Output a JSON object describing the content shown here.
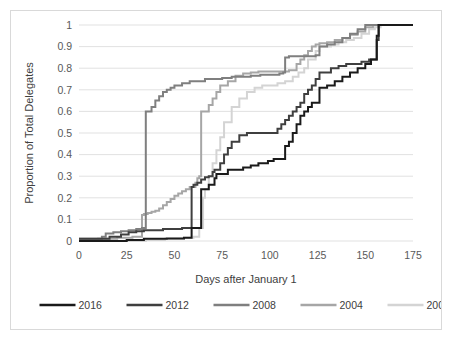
{
  "chart_data": {
    "type": "line",
    "title": "",
    "xlabel": "Days after January 1",
    "ylabel": "Proportion of Total Delegates",
    "xlim": [
      0,
      175
    ],
    "ylim": [
      0,
      1
    ],
    "xticks": [
      "0",
      "25",
      "50",
      "75",
      "100",
      "125",
      "150",
      "175"
    ],
    "xtick_values": [
      0,
      25,
      50,
      75,
      100,
      125,
      150,
      175
    ],
    "yticks": [
      "0",
      "0.1",
      "0.2",
      "0.3",
      "0.4",
      "0.5",
      "0.6",
      "0.7",
      "0.8",
      "0.9",
      "1"
    ],
    "ytick_values": [
      0,
      0.1,
      0.2,
      0.3,
      0.4,
      0.5,
      0.6,
      0.7,
      0.8,
      0.9,
      1
    ],
    "grid": "horizontal",
    "legend_position": "bottom",
    "series": [
      {
        "name": "2016",
        "color": "#1a1a1a",
        "width": 2.0,
        "x": [
          0,
          22,
          25,
          31,
          34,
          40,
          46,
          50,
          55,
          58,
          59,
          60,
          62,
          64,
          66,
          68,
          70,
          71,
          72,
          74,
          78,
          82,
          86,
          90,
          94,
          99,
          102,
          106,
          108,
          110,
          112,
          114,
          116,
          118,
          120,
          122,
          124,
          126,
          130,
          134,
          138,
          142,
          146,
          150,
          153,
          155,
          156,
          157,
          160,
          175
        ],
        "y": [
          0.0,
          0.0,
          0.005,
          0.005,
          0.01,
          0.01,
          0.012,
          0.012,
          0.015,
          0.015,
          0.06,
          0.06,
          0.06,
          0.24,
          0.24,
          0.26,
          0.26,
          0.29,
          0.31,
          0.31,
          0.33,
          0.33,
          0.34,
          0.35,
          0.36,
          0.37,
          0.38,
          0.38,
          0.44,
          0.46,
          0.5,
          0.54,
          0.58,
          0.6,
          0.62,
          0.64,
          0.64,
          0.71,
          0.72,
          0.74,
          0.76,
          0.78,
          0.8,
          0.82,
          0.84,
          0.84,
          0.95,
          1.0,
          1.0,
          1.0
        ]
      },
      {
        "name": "2012",
        "color": "#3f3f3f",
        "width": 2.0,
        "x": [
          0,
          10,
          16,
          22,
          26,
          30,
          34,
          38,
          44,
          50,
          54,
          57,
          58,
          59,
          60,
          62,
          64,
          66,
          68,
          70,
          71,
          72,
          74,
          76,
          78,
          80,
          84,
          88,
          92,
          96,
          100,
          104,
          106,
          108,
          110,
          112,
          114,
          116,
          118,
          120,
          122,
          124,
          126,
          128,
          132,
          136,
          140,
          144,
          148,
          152,
          155,
          156,
          157,
          160,
          175
        ],
        "y": [
          0.01,
          0.01,
          0.02,
          0.03,
          0.04,
          0.045,
          0.05,
          0.05,
          0.055,
          0.055,
          0.06,
          0.06,
          0.06,
          0.25,
          0.26,
          0.27,
          0.285,
          0.295,
          0.3,
          0.32,
          0.33,
          0.33,
          0.36,
          0.4,
          0.43,
          0.46,
          0.49,
          0.5,
          0.5,
          0.5,
          0.5,
          0.52,
          0.54,
          0.56,
          0.58,
          0.6,
          0.62,
          0.64,
          0.68,
          0.7,
          0.72,
          0.75,
          0.78,
          0.78,
          0.8,
          0.81,
          0.82,
          0.82,
          0.83,
          0.84,
          0.84,
          0.93,
          1.0,
          1.0,
          1.0
        ]
      },
      {
        "name": "2008",
        "color": "#7f7f7f",
        "width": 2.0,
        "x": [
          0,
          8,
          12,
          14,
          18,
          22,
          26,
          30,
          33,
          34,
          35,
          36,
          38,
          40,
          42,
          44,
          46,
          48,
          50,
          54,
          58,
          62,
          66,
          70,
          75,
          80,
          85,
          90,
          95,
          100,
          105,
          107,
          108,
          110,
          114,
          118,
          122,
          124,
          126,
          130,
          134,
          138,
          142,
          146,
          150,
          152,
          154,
          156,
          160,
          175
        ],
        "y": [
          0.01,
          0.01,
          0.02,
          0.035,
          0.04,
          0.045,
          0.05,
          0.055,
          0.06,
          0.06,
          0.6,
          0.6,
          0.62,
          0.65,
          0.67,
          0.69,
          0.7,
          0.71,
          0.72,
          0.73,
          0.74,
          0.74,
          0.75,
          0.75,
          0.755,
          0.76,
          0.76,
          0.765,
          0.77,
          0.77,
          0.775,
          0.78,
          0.85,
          0.855,
          0.855,
          0.855,
          0.855,
          0.86,
          0.9,
          0.91,
          0.92,
          0.94,
          0.96,
          0.98,
          1.0,
          1.0,
          1.0,
          1.0,
          1.0,
          1.0
        ]
      },
      {
        "name": "2004",
        "color": "#a6a6a6",
        "width": 2.0,
        "x": [
          0,
          10,
          20,
          28,
          32,
          33,
          34,
          36,
          38,
          40,
          42,
          44,
          46,
          48,
          50,
          52,
          54,
          56,
          58,
          60,
          61,
          62,
          63,
          64,
          66,
          68,
          70,
          72,
          74,
          78,
          82,
          86,
          90,
          94,
          98,
          102,
          106,
          110,
          112,
          114,
          116,
          118,
          120,
          122,
          124,
          126,
          130,
          134,
          138,
          142,
          146,
          150,
          154,
          158,
          160,
          165,
          175
        ],
        "y": [
          0.005,
          0.01,
          0.015,
          0.02,
          0.02,
          0.12,
          0.125,
          0.13,
          0.135,
          0.14,
          0.15,
          0.165,
          0.18,
          0.195,
          0.21,
          0.22,
          0.23,
          0.24,
          0.25,
          0.25,
          0.27,
          0.29,
          0.3,
          0.6,
          0.6,
          0.63,
          0.66,
          0.69,
          0.72,
          0.74,
          0.765,
          0.775,
          0.78,
          0.785,
          0.785,
          0.785,
          0.785,
          0.79,
          0.79,
          0.82,
          0.84,
          0.86,
          0.88,
          0.9,
          0.91,
          0.915,
          0.92,
          0.93,
          0.94,
          0.955,
          0.97,
          0.99,
          1.0,
          1.0,
          1.0,
          1.0,
          1.0
        ]
      },
      {
        "name": "2000",
        "color": "#d4d4d4",
        "width": 2.0,
        "x": [
          0,
          15,
          25,
          35,
          45,
          50,
          55,
          58,
          60,
          62,
          63,
          64,
          65,
          66,
          68,
          70,
          72,
          74,
          76,
          80,
          84,
          88,
          92,
          96,
          100,
          104,
          108,
          112,
          115,
          118,
          120,
          124,
          126,
          128,
          132,
          136,
          140,
          144,
          148,
          152,
          155,
          158,
          162,
          165,
          175
        ],
        "y": [
          0.0,
          0.0,
          0.0,
          0.005,
          0.01,
          0.01,
          0.015,
          0.015,
          0.02,
          0.02,
          0.06,
          0.06,
          0.2,
          0.24,
          0.3,
          0.36,
          0.42,
          0.48,
          0.55,
          0.62,
          0.66,
          0.69,
          0.71,
          0.72,
          0.72,
          0.73,
          0.74,
          0.76,
          0.78,
          0.8,
          0.84,
          0.88,
          0.9,
          0.9,
          0.91,
          0.92,
          0.93,
          0.94,
          0.96,
          0.98,
          0.99,
          1.0,
          1.0,
          1.0,
          1.0
        ]
      }
    ]
  },
  "legend": {
    "items": [
      {
        "label": "2016",
        "color": "#1a1a1a"
      },
      {
        "label": "2012",
        "color": "#3f3f3f"
      },
      {
        "label": "2008",
        "color": "#7f7f7f"
      },
      {
        "label": "2004",
        "color": "#a6a6a6"
      },
      {
        "label": "2000",
        "color": "#d4d4d4"
      }
    ]
  }
}
